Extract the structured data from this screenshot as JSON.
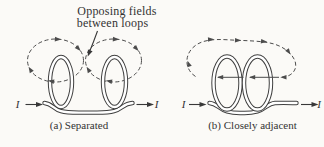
{
  "figure": {
    "annotation": {
      "line1": "Opposing fields",
      "line2": "between loops"
    },
    "panel_a": {
      "caption": "(a) Separated",
      "current_in_label": "I",
      "current_out_label": "I",
      "field_pattern": "two separate dashed field loops, one circling the top of each coil, circulating clockwise so fields oppose in the gap between loops"
    },
    "panel_b": {
      "caption": "(b) Closely adjacent",
      "current_in_label": "I",
      "current_out_label": "I",
      "field_pattern": "one large dashed field loop around both coils; field passes leftward through both loop interiors and returns over the top rightward"
    },
    "icons": [
      "current-direction-arrow",
      "field-circulation-arrow",
      "annotation-pointer-arrow"
    ],
    "colors": {
      "wire_line": "#3f3f3f",
      "field_line": "#4c4c4c",
      "text": "#333333",
      "background": "#fbfaf7",
      "wire_core": "#ffffff"
    }
  }
}
